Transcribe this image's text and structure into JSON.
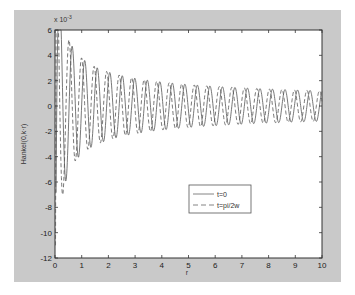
{
  "chart_data": {
    "type": "line",
    "title": "",
    "xlabel": "r",
    "ylabel": "Hankel(0,k·r)",
    "exponent_label": "x 10",
    "exponent_power": "-3",
    "xlim": [
      0,
      10
    ],
    "ylim": [
      -12,
      6
    ],
    "xticks": [
      0,
      1,
      2,
      3,
      4,
      5,
      6,
      7,
      8,
      9,
      10
    ],
    "yticks": [
      -12,
      -10,
      -8,
      -6,
      -4,
      -2,
      0,
      2,
      4,
      6
    ],
    "grid": false,
    "legend_position": "lower-center",
    "series": [
      {
        "name": "t=0",
        "style": "solid",
        "color": "#555555",
        "model": "scale*Y0(k*r)",
        "params": {
          "k": 13.4,
          "scale": 17.4
        },
        "extrema_read": [
          {
            "r": 0.08,
            "y": -10.3
          },
          {
            "r": 0.3,
            "y": 6.0
          },
          {
            "r": 0.55,
            "y": -3.6
          },
          {
            "r": 0.75,
            "y": 3.5
          },
          {
            "r": 1.0,
            "y": -2.8
          },
          {
            "r": 1.25,
            "y": 3.0
          },
          {
            "r": 2.0,
            "y": 2.4
          },
          {
            "r": 3.0,
            "y": 2.0
          },
          {
            "r": 5.0,
            "y": 1.6
          },
          {
            "r": 7.0,
            "y": 1.4
          },
          {
            "r": 10.0,
            "y": 1.2
          }
        ]
      },
      {
        "name": "t=pi/2w",
        "style": "dashed",
        "color": "#555555",
        "model": "scale*J0(k*r)",
        "params": {
          "k": 13.4,
          "scale": 17.4
        },
        "extrema_read": [
          {
            "r": 0.05,
            "y": -11.0
          },
          {
            "r": 0.4,
            "y": 5.0
          },
          {
            "r": 0.65,
            "y": -3.3
          },
          {
            "r": 0.9,
            "y": 3.2
          },
          {
            "r": 2.0,
            "y": -2.2
          },
          {
            "r": 5.0,
            "y": -1.5
          },
          {
            "r": 10.0,
            "y": -1.2
          }
        ]
      }
    ]
  },
  "legend": {
    "items": [
      {
        "label": "t=0",
        "style": "solid"
      },
      {
        "label": "t=pi/2w",
        "style": "dashed"
      }
    ]
  }
}
